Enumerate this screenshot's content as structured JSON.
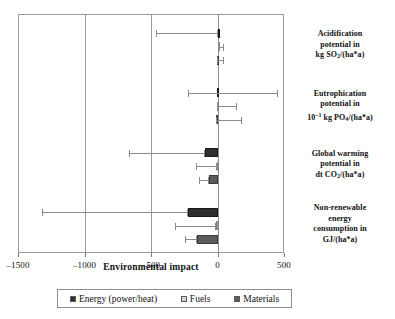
{
  "chart_data": {
    "type": "bar",
    "orientation": "horizontal",
    "title": "",
    "xlabel": "Environmental impact",
    "ylabel": "",
    "xlim": [
      -1500,
      500
    ],
    "xticks": [
      -1500,
      -1000,
      -500,
      0,
      500
    ],
    "xticklabels": [
      "–1500",
      "–1000",
      "–500",
      "0",
      "500"
    ],
    "grid": true,
    "legend_position": "bottom",
    "categories": [
      "Acidification potential in kg SO2/(ha*a)",
      "Eutrophication potential in 10-1 kg PO4/(ha*a)",
      "Global warming potential in dt CO2/(ha*a)",
      "Non-renewable energy consumption in GJ/(ha*a)"
    ],
    "series": [
      {
        "name": "Energy (power/heat)",
        "color": "#2e2e2e",
        "values": [
          -5,
          -8,
          -100,
          -230
        ],
        "err_low": [
          -470,
          -230,
          -670,
          -1325
        ],
        "err_high": [
          -5,
          450,
          -100,
          -230
        ]
      },
      {
        "name": "Fuels",
        "color": "#d5d5d5",
        "values": [
          -5,
          -15,
          -8,
          -20
        ],
        "err_low": [
          -5,
          -15,
          -170,
          -330
        ],
        "err_high": [
          40,
          140,
          -8,
          -20
        ]
      },
      {
        "name": "Materials",
        "color": "#5c5c5c",
        "values": [
          -8,
          -20,
          -75,
          -160
        ],
        "err_low": [
          -8,
          -20,
          -145,
          -250
        ],
        "err_high": [
          45,
          175,
          -75,
          -160
        ]
      }
    ]
  },
  "axis": {
    "title": "Environmental impact",
    "ticklabels": [
      "–1500",
      "–1000",
      "–500",
      "0",
      "500"
    ]
  },
  "category_labels": [
    {
      "line1": "Acidification",
      "line2": "potential in",
      "line3_pre": "kg SO",
      "line3_sub": "2",
      "line3_post": "/(ha*a)"
    },
    {
      "line1": "Eutrophication",
      "line2": "potential in",
      "line3_pre": "10",
      "line3_sup": "–1",
      "line3_mid": " kg PO",
      "line3_sub": "4",
      "line3_post": "/(ha*a)"
    },
    {
      "line1": "Global warming",
      "line2": "potential in",
      "line3_pre": "dt CO",
      "line3_sub": "2",
      "line3_post": "/(ha*a)"
    },
    {
      "line1": "Non-renewable",
      "line2": "energy",
      "line2b": "consumption in",
      "line3_pre": "GJ/(ha*a)"
    }
  ],
  "legend": {
    "items": [
      {
        "label": "Energy (power/heat)",
        "color": "#2e2e2e"
      },
      {
        "label": "Fuels",
        "color": "#d5d5d5"
      },
      {
        "label": "Materials",
        "color": "#5c5c5c"
      }
    ]
  }
}
